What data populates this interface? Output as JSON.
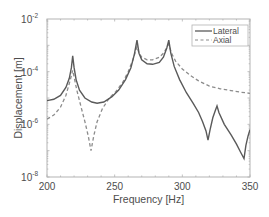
{
  "chart_data": {
    "type": "line",
    "title": "",
    "xlabel": "Frequency [Hz]",
    "ylabel": "Displacement [m]",
    "xlim": [
      200,
      350
    ],
    "ylim": [
      1e-08,
      0.01
    ],
    "yscale": "log",
    "grid": false,
    "legend_position": "upper right",
    "x_ticks": [
      "200",
      "250",
      "300",
      "350"
    ],
    "y_ticks": [
      {
        "base": "10",
        "exp": "-2"
      },
      {
        "base": "10",
        "exp": "-4"
      },
      {
        "base": "10",
        "exp": "-6"
      },
      {
        "base": "10",
        "exp": "-8"
      }
    ],
    "series": [
      {
        "name": "Lateral",
        "style": "solid",
        "color": "#5a5a5a",
        "points_log10": [
          [
            200,
            -5.1
          ],
          [
            205,
            -5.05
          ],
          [
            210,
            -4.9
          ],
          [
            214,
            -4.6
          ],
          [
            216.5,
            -4.25
          ],
          [
            218,
            -3.85
          ],
          [
            219,
            -3.4
          ],
          [
            220,
            -3.85
          ],
          [
            221.5,
            -4.3
          ],
          [
            224,
            -4.7
          ],
          [
            228,
            -5.0
          ],
          [
            233,
            -5.15
          ],
          [
            237,
            -5.2
          ],
          [
            242,
            -5.15
          ],
          [
            248,
            -4.95
          ],
          [
            253,
            -4.7
          ],
          [
            258,
            -4.3
          ],
          [
            262,
            -3.85
          ],
          [
            264.5,
            -3.35
          ],
          [
            266.5,
            -2.8
          ],
          [
            268,
            -3.3
          ],
          [
            270,
            -3.55
          ],
          [
            274,
            -3.7
          ],
          [
            278,
            -3.72
          ],
          [
            283,
            -3.65
          ],
          [
            286,
            -3.45
          ],
          [
            288.5,
            -3.1
          ],
          [
            290,
            -2.8
          ],
          [
            291.5,
            -3.3
          ],
          [
            294,
            -3.8
          ],
          [
            298,
            -4.3
          ],
          [
            303,
            -4.8
          ],
          [
            308,
            -5.2
          ],
          [
            312,
            -5.55
          ],
          [
            315,
            -5.9
          ],
          [
            317.5,
            -6.25
          ],
          [
            319,
            -6.6
          ],
          [
            320.5,
            -6.2
          ],
          [
            322.5,
            -5.75
          ],
          [
            324.5,
            -5.45
          ],
          [
            325.6,
            -5.3
          ],
          [
            327,
            -5.55
          ],
          [
            331,
            -6.0
          ],
          [
            336,
            -6.4
          ],
          [
            340,
            -6.75
          ],
          [
            343,
            -7.05
          ],
          [
            345.6,
            -7.3
          ],
          [
            347,
            -6.8
          ],
          [
            348.5,
            -6.45
          ],
          [
            350,
            -6.2
          ]
        ]
      },
      {
        "name": "Axial",
        "style": "dashed",
        "color": "#8c8c8c",
        "points_log10": [
          [
            200,
            -5.8
          ],
          [
            205,
            -5.65
          ],
          [
            210,
            -5.35
          ],
          [
            214,
            -4.9
          ],
          [
            216.5,
            -4.45
          ],
          [
            218,
            -4.15
          ],
          [
            219,
            -3.95
          ],
          [
            220,
            -4.2
          ],
          [
            222,
            -4.7
          ],
          [
            225,
            -5.3
          ],
          [
            228,
            -5.9
          ],
          [
            230.5,
            -6.45
          ],
          [
            232.5,
            -7.0
          ],
          [
            234.5,
            -6.45
          ],
          [
            237,
            -5.9
          ],
          [
            241,
            -5.4
          ],
          [
            246,
            -5.0
          ],
          [
            251,
            -4.75
          ],
          [
            256,
            -4.4
          ],
          [
            260,
            -4.0
          ],
          [
            263.5,
            -3.55
          ],
          [
            266.5,
            -3.05
          ],
          [
            268,
            -3.3
          ],
          [
            270,
            -3.45
          ],
          [
            274,
            -3.55
          ],
          [
            278,
            -3.55
          ],
          [
            283,
            -3.45
          ],
          [
            286,
            -3.3
          ],
          [
            288.5,
            -3.1
          ],
          [
            290,
            -2.95
          ],
          [
            292,
            -3.3
          ],
          [
            295,
            -3.6
          ],
          [
            300,
            -3.9
          ],
          [
            306,
            -4.15
          ],
          [
            312,
            -4.35
          ],
          [
            320,
            -4.55
          ],
          [
            328,
            -4.65
          ],
          [
            336,
            -4.72
          ],
          [
            343,
            -4.78
          ],
          [
            350,
            -4.82
          ]
        ]
      }
    ]
  },
  "legend": {
    "items": [
      {
        "label": "Lateral",
        "style": "solid"
      },
      {
        "label": "Axial",
        "style": "dashed"
      }
    ]
  },
  "colors": {
    "axis": "#b3b3b3",
    "text": "#4d4d4d",
    "lateral": "#5a5a5a",
    "axial": "#8c8c8c"
  }
}
